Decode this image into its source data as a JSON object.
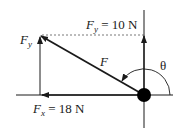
{
  "diagram": {
    "labels": {
      "fy_top_var": "F",
      "fy_top_sub": "y",
      "fy_top_value": " = 10 N",
      "fy_left_var": "F",
      "fy_left_sub": "y",
      "f_var": "F",
      "theta": "θ",
      "fx_var": "F",
      "fx_sub": "x",
      "fx_value": " = 18 N"
    },
    "colors": {
      "line": "#1a1a1a",
      "dotted": "#555555",
      "body": "#000000"
    }
  }
}
